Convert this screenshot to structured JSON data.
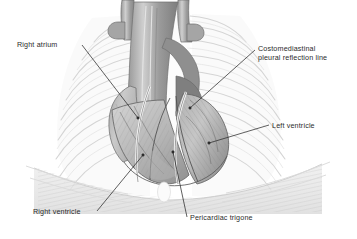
{
  "figure": {
    "background_color": "#ffffff",
    "text_color": "#2b2b2b",
    "leader_line_color": "#2b2b2b",
    "palette": {
      "rib_outline": "#d2d2d2",
      "rib_fill": "#fbfbfb",
      "lung_tint": "#f2f2f2",
      "vessel_dark": "#8a8a8a",
      "vessel_mid": "#a6a6a6",
      "vessel_light": "#c4c4c4",
      "atrium": "#c8c8c8",
      "ventricle": "#b9b9b9",
      "ventricle_dark": "#9d9d9d",
      "diaphragm": "#e6e6e6",
      "reflection_line": "#ffffff"
    }
  },
  "labels": [
    {
      "id": "right-atrium",
      "lines": [
        "Right atrium"
      ],
      "anchor": "left",
      "leader": {
        "from": [
          82,
          45
        ],
        "to": [
          138,
          118
        ]
      }
    },
    {
      "id": "costomediastinal",
      "lines": [
        "Costomediastinal",
        "pleural reflection line"
      ],
      "anchor": "right",
      "leader": {
        "from": [
          255,
          50
        ],
        "to": [
          190,
          108
        ]
      }
    },
    {
      "id": "left-ventricle",
      "lines": [
        "Left ventricle"
      ],
      "anchor": "right",
      "leader": {
        "from": [
          269,
          125
        ],
        "to": [
          209,
          143
        ]
      }
    },
    {
      "id": "right-ventricle",
      "lines": [
        "Right ventricle"
      ],
      "anchor": "left",
      "leader": {
        "from": [
          97,
          211
        ],
        "to": [
          143,
          155
        ]
      }
    },
    {
      "id": "pericardiac-trigone",
      "lines": [
        "Pericardiac trigone"
      ],
      "anchor": "right",
      "leader": {
        "from": [
          187,
          217
        ],
        "to": [
          173,
          152
        ]
      }
    }
  ],
  "structures": [
    "rib cage",
    "great vessels",
    "right atrium",
    "right ventricle",
    "left ventricle",
    "costomediastinal pleural reflection line",
    "pericardiac trigone",
    "diaphragm"
  ]
}
